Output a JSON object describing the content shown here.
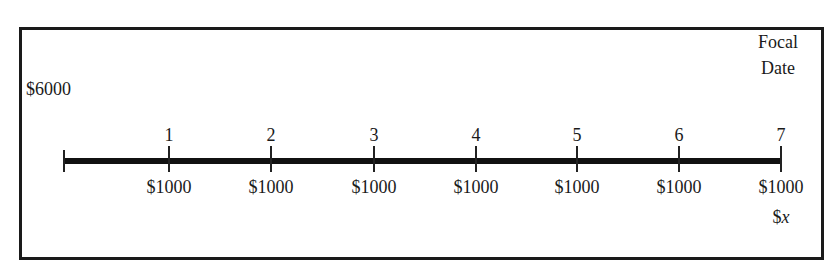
{
  "diagram": {
    "type": "time-line",
    "present_value_label": "$6000",
    "focal_date_label_line1": "Focal",
    "focal_date_label_line2": "Date",
    "periods": [
      {
        "label": "1",
        "payment": "$1000"
      },
      {
        "label": "2",
        "payment": "$1000"
      },
      {
        "label": "3",
        "payment": "$1000"
      },
      {
        "label": "4",
        "payment": "$1000"
      },
      {
        "label": "5",
        "payment": "$1000"
      },
      {
        "label": "6",
        "payment": "$1000"
      },
      {
        "label": "7",
        "payment": "$1000"
      }
    ],
    "unknown_payment_symbol": "$",
    "unknown_payment_var": "x"
  }
}
